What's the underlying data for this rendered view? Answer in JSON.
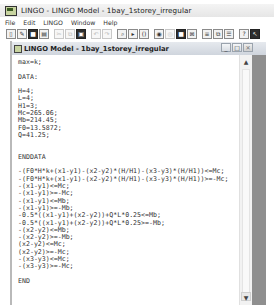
{
  "app": {
    "title": "LINGO - LINGO Model - 1bay_1storey_irregular"
  },
  "menu": [
    "File",
    "Edit",
    "LINGO",
    "Window",
    "Help"
  ],
  "toolbar": {
    "buttons": [
      {
        "name": "new-icon",
        "glyph": "▯"
      },
      {
        "name": "open-icon",
        "glyph": "✎"
      },
      {
        "name": "save-icon",
        "glyph": "■"
      },
      {
        "name": "print-icon",
        "glyph": "▤"
      },
      {
        "name": "cut-icon",
        "glyph": "✂"
      },
      {
        "name": "copy-icon",
        "glyph": "⧉"
      },
      {
        "name": "paste-icon",
        "glyph": "▣"
      },
      {
        "name": "undo-icon",
        "glyph": "↶"
      },
      {
        "name": "redo-icon",
        "glyph": "↷"
      },
      {
        "name": "find-icon",
        "glyph": "⌕"
      },
      {
        "name": "goto-icon",
        "glyph": "▸"
      },
      {
        "name": "match-paren-icon",
        "glyph": "()"
      },
      {
        "name": "solve-icon",
        "glyph": "◉"
      },
      {
        "name": "solution-icon",
        "glyph": "◎"
      },
      {
        "name": "send-to-back-icon",
        "glyph": "■"
      },
      {
        "name": "close-all-icon",
        "glyph": "⊠"
      },
      {
        "name": "tile-icon",
        "glyph": "≡"
      },
      {
        "name": "cascade-icon",
        "glyph": "⧉"
      },
      {
        "name": "options-icon",
        "glyph": "☰"
      },
      {
        "name": "help-icon",
        "glyph": "?"
      },
      {
        "name": "context-help-icon",
        "glyph": "↖"
      }
    ]
  },
  "model_window": {
    "title": "LINGO Model - 1bay_1storey_irregular",
    "controls": {
      "minimize": "_",
      "maximize": "□",
      "close": "✕"
    },
    "code_lines": [
      "max=k;",
      "",
      "DATA:",
      "",
      "H=4;",
      "L=4;",
      "H1=3;",
      "Mc=265.06;",
      "Mb=214.45;",
      "F0=13.5872;",
      "Q=41.25;",
      "",
      "",
      "ENDDATA",
      "",
      "-(F0*H*k+(x1-y1)-(x2-y2)*(H/H1)-(x3-y3)*(H/H1))<=Mc;",
      "-(F0*H*k+(x1-y1)-(x2-y2)*(H/H1)-(x3-y3)*(H/H1))>=-Mc;",
      "-(x1-y1)<=Mc;",
      "-(x1-y1)>=-Mc;",
      "-(x1-y1)<=Mb;",
      "-(x1-y1)>=-Mb;",
      "-0.5*((x1-y1)+(x2-y2))+Q*L*0.25<=Mb;",
      "-0.5*((x1-y1)+(x2-y2))+Q*L*0.25>=-Mb;",
      "-(x2-y2)<=Mb;",
      "-(x2-y2)>=-Mb;",
      "(x2-y2)<=Mc;",
      "(x2-y2)>=-Mc;",
      "-(x3-y3)<=Mc;",
      "-(x3-y3)>=-Mc;",
      "",
      "END"
    ],
    "scrollbar": {
      "up": "▲",
      "down": "▼"
    }
  }
}
